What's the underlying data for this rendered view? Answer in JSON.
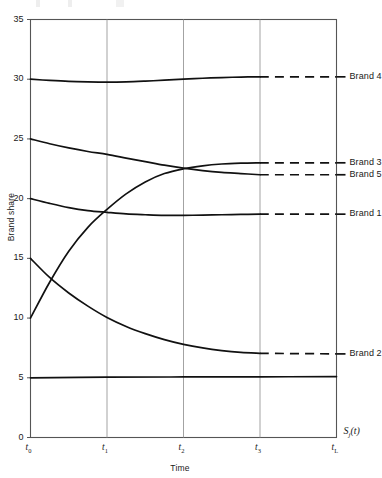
{
  "chart_data": {
    "type": "line",
    "title": "",
    "xlabel": "Time",
    "ylabel": "Brand share",
    "corner_label": "S_j(t)",
    "ylim": [
      0,
      35
    ],
    "yticks": [
      0,
      5,
      10,
      15,
      20,
      25,
      30,
      35
    ],
    "ytick_labels": [
      "0",
      "5",
      "10",
      "15",
      "20",
      "25",
      "30",
      "35"
    ],
    "xlim": [
      0,
      4
    ],
    "xticks": [
      0,
      1,
      2,
      3,
      4
    ],
    "xtick_labels": [
      "t0",
      "t1",
      "t2",
      "t3",
      "tL"
    ],
    "xtick_base": [
      "t",
      "t",
      "t",
      "t",
      "t"
    ],
    "xtick_sub": [
      "0",
      "1",
      "2",
      "3",
      "L"
    ],
    "grid": "vertical",
    "legend_position": "right-inline",
    "dash_start_x": 3,
    "series": [
      {
        "name": "Brand 4",
        "label": "Brand 4",
        "start_value": 30.0,
        "end_value": 30.2,
        "x": [
          0,
          0.25,
          0.5,
          0.75,
          1.0,
          1.25,
          1.5,
          1.75,
          2.0,
          2.25,
          2.5,
          2.75,
          3.0,
          3.5,
          4.0
        ],
        "values": [
          30.0,
          29.9,
          29.82,
          29.78,
          29.76,
          29.78,
          29.84,
          29.92,
          30.0,
          30.08,
          30.14,
          30.18,
          30.2,
          30.2,
          30.2
        ]
      },
      {
        "name": "Brand 5",
        "label": "Brand 5",
        "start_value": 25.0,
        "end_value": 22.0,
        "x": [
          0,
          0.25,
          0.5,
          0.75,
          1.0,
          1.25,
          1.5,
          1.75,
          2.0,
          2.25,
          2.5,
          2.75,
          3.0,
          3.5,
          4.0
        ],
        "values": [
          25.0,
          24.6,
          24.25,
          23.95,
          23.7,
          23.4,
          23.1,
          22.8,
          22.55,
          22.35,
          22.2,
          22.1,
          22.0,
          22.0,
          22.0
        ]
      },
      {
        "name": "Brand 3",
        "label": "Brand 3",
        "start_value": 10.0,
        "end_value": 23.0,
        "x": [
          0,
          0.25,
          0.5,
          0.75,
          1.0,
          1.25,
          1.5,
          1.75,
          2.0,
          2.25,
          2.5,
          2.75,
          3.0,
          3.5,
          4.0
        ],
        "values": [
          10.0,
          13.0,
          15.6,
          17.6,
          19.1,
          20.4,
          21.4,
          22.1,
          22.5,
          22.75,
          22.9,
          22.97,
          23.0,
          23.0,
          23.0
        ]
      },
      {
        "name": "Brand 1",
        "label": "Brand 1",
        "start_value": 20.0,
        "end_value": 18.7,
        "x": [
          0,
          0.25,
          0.5,
          0.75,
          1.0,
          1.25,
          1.5,
          1.75,
          2.0,
          2.25,
          2.5,
          2.75,
          3.0,
          3.5,
          4.0
        ],
        "values": [
          20.0,
          19.6,
          19.25,
          19.0,
          18.85,
          18.72,
          18.65,
          18.6,
          18.6,
          18.62,
          18.65,
          18.68,
          18.7,
          18.7,
          18.7
        ]
      },
      {
        "name": "Brand 2",
        "label": "Brand 2",
        "start_value": 15.0,
        "end_value": 7.0,
        "x": [
          0,
          0.25,
          0.5,
          0.75,
          1.0,
          1.25,
          1.5,
          1.75,
          2.0,
          2.25,
          2.5,
          2.75,
          3.0,
          3.5,
          4.0
        ],
        "values": [
          15.0,
          13.4,
          12.1,
          11.0,
          10.05,
          9.3,
          8.7,
          8.2,
          7.8,
          7.5,
          7.28,
          7.13,
          7.05,
          7.0,
          7.0
        ]
      },
      {
        "name": "baseline",
        "label": "",
        "start_value": 5.0,
        "end_value": 5.1,
        "x": [
          0,
          1,
          2,
          3,
          4
        ],
        "values": [
          5.0,
          5.05,
          5.07,
          5.08,
          5.1
        ]
      }
    ]
  },
  "colors": {
    "curve": "#111111",
    "axis": "#555555",
    "grid": "#999999",
    "text": "#1a1a1a",
    "background": "#ffffff"
  }
}
